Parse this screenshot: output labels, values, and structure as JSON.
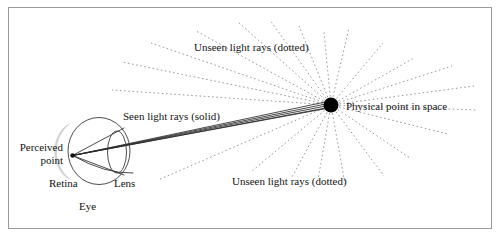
{
  "figure": {
    "kind": "optics-ray-diagram",
    "background_color": "#ffffff",
    "border_color": "#9a9a9a",
    "border": {
      "x": 8,
      "y": 7,
      "width": 484,
      "height": 222
    }
  },
  "labels": {
    "unseen_rays_top": "Unseen light rays (dotted)",
    "unseen_rays_bottom": "Unseen light rays (dotted)",
    "seen_rays": "Seen light rays (solid)",
    "physical_point": "Physical point in space",
    "perceived_point_line1": "Perceived",
    "perceived_point_line2": "point",
    "retina": "Retina",
    "lens": "Lens",
    "eye": "Eye"
  },
  "colors": {
    "ink": "#131313",
    "solid_ray": "#2b2b2b",
    "dotted_ray": "#8e8e8e",
    "eye_outline": "#3a3a3a",
    "retina_fill": "#d2d2d2",
    "point_fill": "#000000",
    "frame": "#9a9a9a"
  },
  "geometry": {
    "physical_point": {
      "x": 331,
      "y": 105,
      "r": 7.5
    },
    "perceived_point": {
      "x": 72.5,
      "y": 155.5,
      "r": 2.2
    },
    "eye_circle": {
      "cx": 99,
      "cy": 151,
      "rx": 31,
      "ry": 33.5
    },
    "lens_ellipse": {
      "cx": 117,
      "cy": 152,
      "rx": 9.5,
      "ry": 21
    },
    "retina_arc_note": "shaded crescent on left inner wall of eye"
  },
  "rays": {
    "seen_solid_count": 5,
    "seen_solid_description": "Five solid rays converge from the physical point through the lens onto the perceived point on the retina",
    "unseen_dotted_count": 20,
    "unseen_dotted_description": "Dotted rays radiate outward from the physical point in all other directions"
  }
}
